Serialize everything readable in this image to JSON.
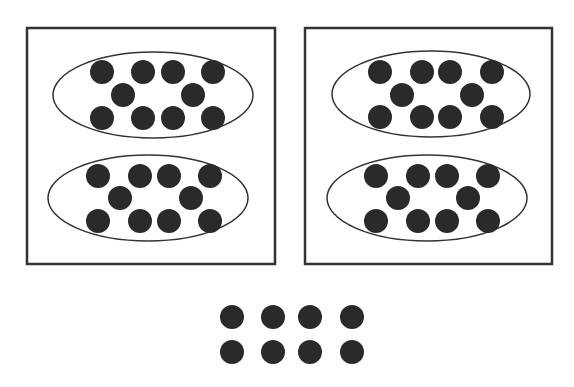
{
  "diagram": {
    "colors": {
      "background": "#ffffff",
      "stroke": "#333333",
      "dot": "#2a2a2a"
    },
    "dot_radius": 12,
    "boxes": [
      {
        "x": 27,
        "y": 28,
        "w": 248,
        "h": 236,
        "groups": [
          {
            "cx": 153,
            "cy": 95,
            "rx": 100,
            "ry": 43,
            "count": 10,
            "dots": [
              [
                102,
                72
              ],
              [
                143,
                72
              ],
              [
                173,
                72
              ],
              [
                213,
                72
              ],
              [
                123,
                95
              ],
              [
                193,
                95
              ],
              [
                102,
                118
              ],
              [
                143,
                118
              ],
              [
                173,
                118
              ],
              [
                213,
                118
              ]
            ]
          },
          {
            "cx": 148,
            "cy": 198,
            "rx": 100,
            "ry": 43,
            "count": 10,
            "dots": [
              [
                98,
                176
              ],
              [
                140,
                176
              ],
              [
                169,
                176
              ],
              [
                210,
                176
              ],
              [
                120,
                198
              ],
              [
                191,
                198
              ],
              [
                98,
                221
              ],
              [
                140,
                221
              ],
              [
                169,
                221
              ],
              [
                210,
                221
              ]
            ]
          }
        ]
      },
      {
        "x": 305,
        "y": 28,
        "w": 247,
        "h": 236,
        "groups": [
          {
            "cx": 431,
            "cy": 94,
            "rx": 99,
            "ry": 43,
            "count": 10,
            "dots": [
              [
                380,
                72
              ],
              [
                422,
                72
              ],
              [
                450,
                72
              ],
              [
                492,
                72
              ],
              [
                402,
                95
              ],
              [
                472,
                95
              ],
              [
                380,
                117
              ],
              [
                422,
                117
              ],
              [
                450,
                117
              ],
              [
                492,
                117
              ]
            ]
          },
          {
            "cx": 427,
            "cy": 198,
            "rx": 100,
            "ry": 43,
            "count": 10,
            "dots": [
              [
                376,
                176
              ],
              [
                418,
                176
              ],
              [
                447,
                176
              ],
              [
                488,
                176
              ],
              [
                398,
                198
              ],
              [
                468,
                198
              ],
              [
                376,
                221
              ],
              [
                418,
                221
              ],
              [
                447,
                221
              ],
              [
                488,
                221
              ]
            ]
          }
        ]
      }
    ],
    "loose_dots": {
      "count": 8,
      "dots": [
        [
          232,
          317
        ],
        [
          273,
          317
        ],
        [
          310,
          317
        ],
        [
          352,
          317
        ],
        [
          232,
          352
        ],
        [
          273,
          352
        ],
        [
          310,
          352
        ],
        [
          352,
          352
        ]
      ]
    }
  }
}
